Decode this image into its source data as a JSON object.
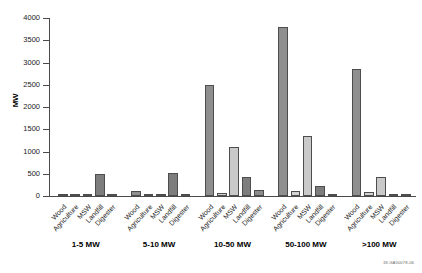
{
  "footnote": "18-GA50078-06",
  "chart_data": {
    "type": "bar",
    "title": "",
    "xlabel": "",
    "ylabel": "MW",
    "ylim": [
      0,
      4000
    ],
    "yticks": [
      0,
      500,
      1000,
      1500,
      2000,
      2500,
      3000,
      3500,
      4000
    ],
    "grid": false,
    "legend": "none",
    "categories": [
      "Wood",
      "Agriculture",
      "MSW",
      "Landfill",
      "Digester"
    ],
    "groups": [
      "1-5 MW",
      "5-10 MW",
      "10-50 MW",
      "50-100 MW",
      ">100 MW"
    ],
    "series": [
      {
        "name": "Wood",
        "color": "#8f8f8f",
        "values": [
          20,
          110,
          2500,
          3800,
          2850
        ]
      },
      {
        "name": "Agriculture",
        "color": "#d2d2d2",
        "values": [
          8,
          15,
          60,
          110,
          90
        ]
      },
      {
        "name": "MSW",
        "color": "#c9c9c9",
        "values": [
          10,
          12,
          1100,
          1350,
          420
        ]
      },
      {
        "name": "Landfill",
        "color": "#7d7d7d",
        "values": [
          505,
          510,
          430,
          230,
          18
        ]
      },
      {
        "name": "Digester",
        "color": "#8c8c8c",
        "values": [
          25,
          20,
          130,
          20,
          10
        ]
      }
    ]
  }
}
